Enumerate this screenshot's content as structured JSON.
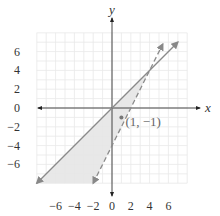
{
  "chart_data": {
    "type": "line",
    "title": "",
    "xlabel": "x",
    "ylabel": "y",
    "xlim": [
      -8,
      8
    ],
    "ylim": [
      -8,
      8
    ],
    "grid": true,
    "grid_step": 1,
    "x_ticks": [
      -6,
      -4,
      -2,
      0,
      2,
      4,
      6
    ],
    "y_ticks": [
      6,
      4,
      2,
      0,
      -2,
      -4,
      -6
    ],
    "series": [
      {
        "name": "boundary-solid",
        "equation": "y = x",
        "style": "solid",
        "color": "#888888",
        "points": [
          [
            -8,
            -8
          ],
          [
            7,
            7
          ]
        ],
        "arrows": "both"
      },
      {
        "name": "boundary-dashed",
        "equation": "y = 2x - 4",
        "style": "dashed",
        "color": "#888888",
        "points": [
          [
            -2,
            -8
          ],
          [
            5.4,
            6.8
          ]
        ],
        "arrows": "both"
      }
    ],
    "shaded_region": {
      "description": "y <= x and y > 2x - 4",
      "vertices": [
        [
          -8,
          -8
        ],
        [
          4,
          4
        ],
        [
          -2,
          -8
        ]
      ],
      "color": "#e6e6e6"
    },
    "annotations": [
      {
        "point": [
          1,
          -1
        ],
        "label": "(1, −1)"
      }
    ]
  },
  "labels": {
    "x_axis": "x",
    "y_axis": "y",
    "point": "(1, −1)",
    "ticks_x": [
      "−6",
      "−4",
      "−2",
      "0",
      "2",
      "4",
      "6"
    ],
    "ticks_y": [
      "6",
      "4",
      "2",
      "0",
      "−2",
      "−4",
      "−6"
    ]
  }
}
